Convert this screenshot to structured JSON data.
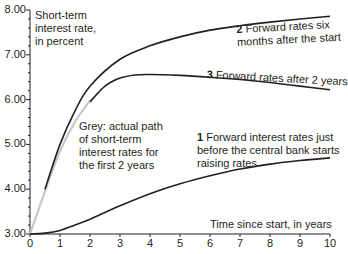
{
  "chart_data": {
    "type": "line",
    "title": "",
    "ylabel": "Short-term interest rate, in percent",
    "xlabel": "Time since start, in years",
    "xlim": [
      0,
      10
    ],
    "ylim": [
      3.0,
      8.0
    ],
    "x_ticks": [
      "0",
      "1",
      "2",
      "3",
      "4",
      "5",
      "6",
      "7",
      "8",
      "9",
      "10"
    ],
    "y_ticks": [
      "3.00",
      "4.00",
      "5.00",
      "6.00",
      "7.00",
      "8.00"
    ],
    "grid": false,
    "series": [
      {
        "name": "Forward interest rates just before the central bank starts raising rates",
        "number": "1",
        "color": "#231f20",
        "x": [
          0,
          0.5,
          1,
          1.5,
          2,
          3,
          4,
          5,
          6,
          7,
          8,
          9,
          10
        ],
        "y": [
          3.0,
          3.02,
          3.08,
          3.2,
          3.33,
          3.63,
          3.9,
          4.12,
          4.3,
          4.45,
          4.56,
          4.64,
          4.7
        ]
      },
      {
        "name": "Forward rates six months after the start",
        "number": "2",
        "color": "#231f20",
        "x": [
          0.5,
          1,
          1.5,
          2,
          3,
          4,
          5,
          6,
          7,
          8,
          9,
          10
        ],
        "y": [
          4.0,
          5.0,
          5.75,
          6.3,
          6.9,
          7.2,
          7.4,
          7.55,
          7.65,
          7.73,
          7.8,
          7.86
        ]
      },
      {
        "name": "Forward rates after 2 years",
        "number": "3",
        "color": "#231f20",
        "x": [
          2,
          2.5,
          3,
          3.5,
          4,
          5,
          6,
          7,
          8,
          9,
          10
        ],
        "y": [
          5.95,
          6.3,
          6.48,
          6.55,
          6.56,
          6.54,
          6.5,
          6.45,
          6.38,
          6.3,
          6.22
        ]
      },
      {
        "name": "Actual path of short-term interest rates for the first 2 years",
        "color": "#c8c8c8",
        "x": [
          0,
          0.5,
          1,
          1.5,
          2
        ],
        "y": [
          3.0,
          3.95,
          4.85,
          5.5,
          5.98
        ]
      }
    ],
    "annotations": [
      {
        "text": "Grey: actual path of short-term interest rates for the first 2 years"
      }
    ]
  },
  "labels": {
    "ylabel_lines": [
      "Short-term",
      "interest rate,",
      "in percent"
    ],
    "xlabel": "Time since start, in years",
    "s1_num": "1",
    "s1_lines": [
      "Forward interest rates just",
      "before the central bank starts",
      "raising rates"
    ],
    "s2_num": "2",
    "s2_lines": [
      "Forward rates six",
      "months after the start"
    ],
    "s3_num": "3",
    "s3_text": "Forward rates after 2 years",
    "grey_lines": [
      "Grey: actual path",
      "of short-term",
      "interest rates for",
      "the first 2 years"
    ]
  }
}
